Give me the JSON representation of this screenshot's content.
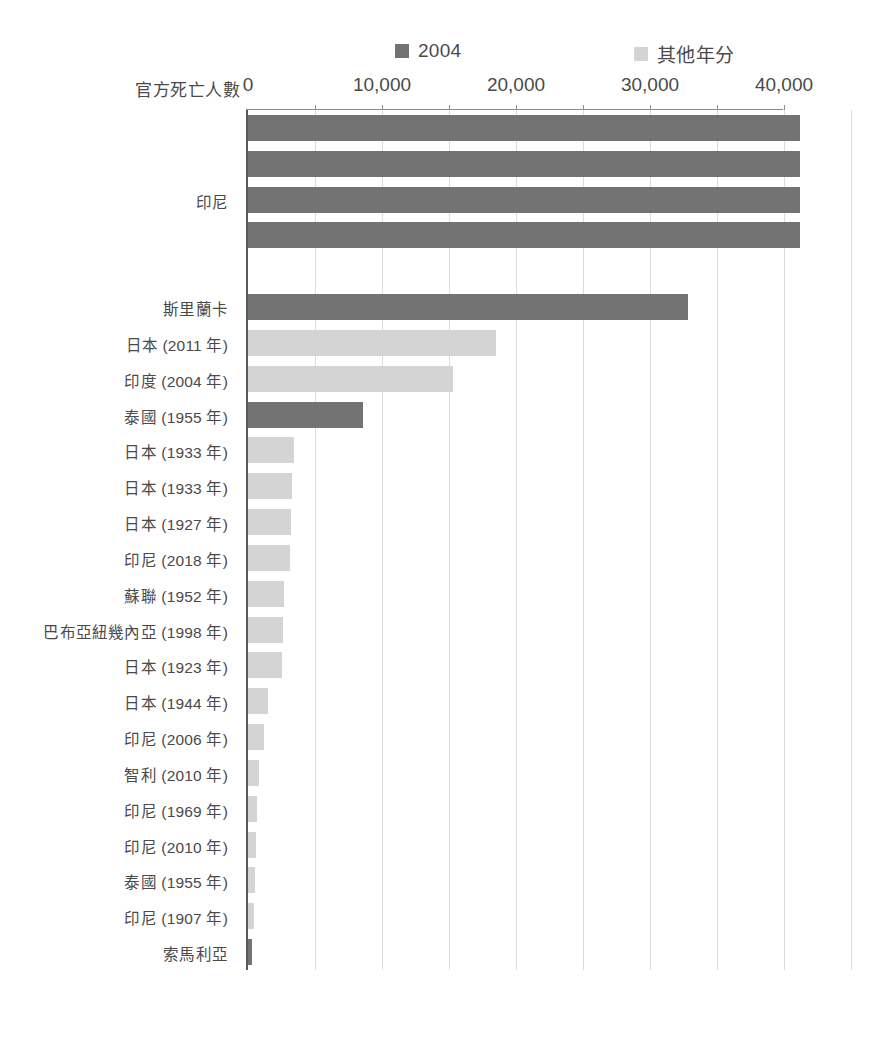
{
  "axis_title": "官方死亡人數",
  "legend": [
    {
      "label": "2004",
      "color": "#737373",
      "swatch_name": "legend-swatch-2004"
    },
    {
      "label": "其他年分",
      "color": "#d4d4d4",
      "swatch_name": "legend-swatch-other-years"
    }
  ],
  "tick_labels": [
    "0",
    "10,000",
    "20,000",
    "30,000",
    "40,000"
  ],
  "colors": {
    "series_2004": "#737373",
    "series_other": "#d4d4d4",
    "axis": "#595959",
    "gridline": "#dcdcdc",
    "text": "#4a4a4a"
  },
  "group_labels": [
    {
      "text": "印尼",
      "row_index": 2
    }
  ],
  "chart_data": {
    "type": "bar",
    "orientation": "horizontal",
    "title": "",
    "subtitle": "",
    "xlabel": "官方死亡人數",
    "ylabel": "",
    "xlim": [
      0,
      47500
    ],
    "xticks": [
      0,
      10000,
      20000,
      30000,
      40000
    ],
    "xticklabels": [
      "0",
      "10,000",
      "20,000",
      "30,000",
      "40,000"
    ],
    "grid": "vertical",
    "legend_position": "top",
    "series": [
      {
        "name": "2004",
        "color": "#737373"
      },
      {
        "name": "其他年分",
        "color": "#d4d4d4"
      }
    ],
    "categories": [
      "印尼",
      "印尼",
      "印尼",
      "印尼",
      "斯里蘭卡",
      "日本 (2011 年)",
      "印度 (2004 年)",
      "泰國 (1955 年)",
      "日本 (1933 年)",
      "日本 (1933 年)",
      "日本 (1927 年)",
      "印尼 (2018 年)",
      "蘇聯 (1952 年)",
      "巴布亞紐幾內亞 (1998 年)",
      "日本 (1923 年)",
      "日本 (1944 年)",
      "印尼 (2006 年)",
      "智利 (2010 年)",
      "印尼 (1969 年)",
      "印尼 (2010 年)",
      "泰國 (1955 年)",
      "印尼 (1907 年)",
      "索馬利亞"
    ],
    "bars": [
      {
        "category": "印尼",
        "value": 41200,
        "series": "2004",
        "row": 0,
        "show_label": false
      },
      {
        "category": "印尼",
        "value": 41200,
        "series": "2004",
        "row": 1,
        "show_label": false
      },
      {
        "category": "印尼",
        "value": 41200,
        "series": "2004",
        "row": 2,
        "show_label": true
      },
      {
        "category": "印尼",
        "value": 41200,
        "series": "2004",
        "row": 3,
        "show_label": false
      },
      {
        "category": "",
        "value": 0,
        "series": "2004",
        "row": 4,
        "show_label": false
      },
      {
        "category": "斯里蘭卡",
        "value": 32800,
        "series": "2004",
        "row": 5,
        "show_label": true
      },
      {
        "category": "日本 (2011 年)",
        "value": 18500,
        "series": "其他年分",
        "row": 6,
        "show_label": true
      },
      {
        "category": "印度 (2004 年)",
        "value": 15300,
        "series": "其他年分",
        "row": 7,
        "show_label": true
      },
      {
        "category": "泰國 (1955 年)",
        "value": 8600,
        "series": "2004",
        "row": 8,
        "show_label": true
      },
      {
        "category": "日本 (1933 年)",
        "value": 3400,
        "series": "其他年分",
        "row": 9,
        "show_label": true
      },
      {
        "category": "日本 (1933 年)",
        "value": 3300,
        "series": "其他年分",
        "row": 10,
        "show_label": true
      },
      {
        "category": "日本 (1927 年)",
        "value": 3200,
        "series": "其他年分",
        "row": 11,
        "show_label": true
      },
      {
        "category": "印尼 (2018 年)",
        "value": 3100,
        "series": "其他年分",
        "row": 12,
        "show_label": true
      },
      {
        "category": "蘇聯 (1952 年)",
        "value": 2700,
        "series": "其他年分",
        "row": 13,
        "show_label": true
      },
      {
        "category": "巴布亞紐幾內亞 (1998 年)",
        "value": 2600,
        "series": "其他年分",
        "row": 14,
        "show_label": true
      },
      {
        "category": "日本 (1923 年)",
        "value": 2500,
        "series": "其他年分",
        "row": 15,
        "show_label": true
      },
      {
        "category": "日本 (1944 年)",
        "value": 1500,
        "series": "其他年分",
        "row": 16,
        "show_label": true
      },
      {
        "category": "印尼 (2006 年)",
        "value": 1200,
        "series": "其他年分",
        "row": 17,
        "show_label": true
      },
      {
        "category": "智利 (2010 年)",
        "value": 800,
        "series": "其他年分",
        "row": 18,
        "show_label": true
      },
      {
        "category": "印尼 (1969 年)",
        "value": 700,
        "series": "其他年分",
        "row": 19,
        "show_label": true
      },
      {
        "category": "印尼 (2010 年)",
        "value": 600,
        "series": "其他年分",
        "row": 20,
        "show_label": true
      },
      {
        "category": "泰國 (1955 年)",
        "value": 500,
        "series": "其他年分",
        "row": 21,
        "show_label": true
      },
      {
        "category": "印尼 (1907 年)",
        "value": 420,
        "series": "其他年分",
        "row": 22,
        "show_label": true
      },
      {
        "category": "索馬利亞",
        "value": 330,
        "series": "2004",
        "row": 23,
        "show_label": true
      }
    ]
  }
}
